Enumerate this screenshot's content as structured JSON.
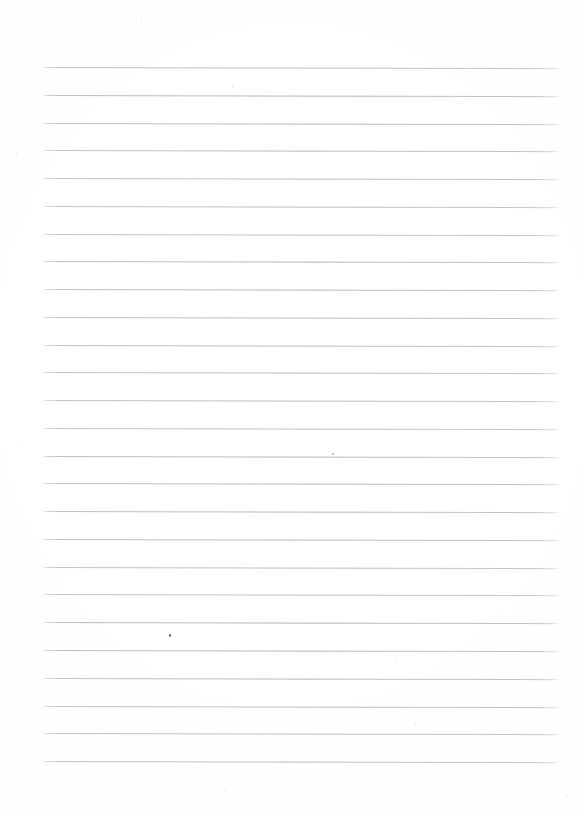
{
  "document": {
    "kind": "ruled-notebook-paper",
    "title": "Blank lined paper",
    "page_width": 584,
    "page_height": 816,
    "background_color": "#ffffff",
    "content_text": "",
    "is_blank": true
  },
  "ruling": {
    "line_color": "#b4b8bd",
    "line_thickness_px": 1,
    "line_count": 26,
    "first_line_y": 67,
    "line_spacing_px": 27.76,
    "line_start_x": 44,
    "line_end_x": 558,
    "line_length_px": 514,
    "skew_degrees": 0.13,
    "style": "single-ruled-horizontal",
    "margin_rule": "none",
    "line_ys": [
      67.0,
      94.8,
      122.5,
      150.3,
      178.0,
      205.8,
      233.6,
      261.3,
      289.1,
      316.8,
      344.6,
      372.4,
      400.1,
      427.9,
      455.6,
      483.4,
      511.2,
      538.9,
      566.7,
      594.4,
      622.2,
      650.0,
      677.7,
      705.5,
      733.2,
      761.0
    ]
  },
  "margins": {
    "top_px": 67,
    "bottom_px": 55,
    "left_px": 44,
    "right_px": 26
  },
  "artifacts": {
    "label": "scan-dust-specks",
    "specks": [
      {
        "x": 169,
        "y": 634,
        "size": 2.2,
        "color": "#5b5b5f"
      },
      {
        "x": 332,
        "y": 453,
        "size": 1.6,
        "color": "#b6b6ba"
      },
      {
        "x": 141,
        "y": 18,
        "size": 1.3,
        "color": "#dcdcde"
      },
      {
        "x": 232,
        "y": 86,
        "size": 1.2,
        "color": "#e2e2e4"
      },
      {
        "x": 16,
        "y": 152,
        "size": 1.2,
        "color": "#e4e4e6"
      },
      {
        "x": 22,
        "y": 445,
        "size": 1.2,
        "color": "#e6e6e8"
      },
      {
        "x": 396,
        "y": 660,
        "size": 1.2,
        "color": "#e2e2e4"
      },
      {
        "x": 415,
        "y": 723,
        "size": 1.1,
        "color": "#e6e6e8"
      },
      {
        "x": 566,
        "y": 795,
        "size": 1.1,
        "color": "#e0e0e2"
      },
      {
        "x": 224,
        "y": 790,
        "size": 1.1,
        "color": "#e8e8ea"
      }
    ]
  }
}
